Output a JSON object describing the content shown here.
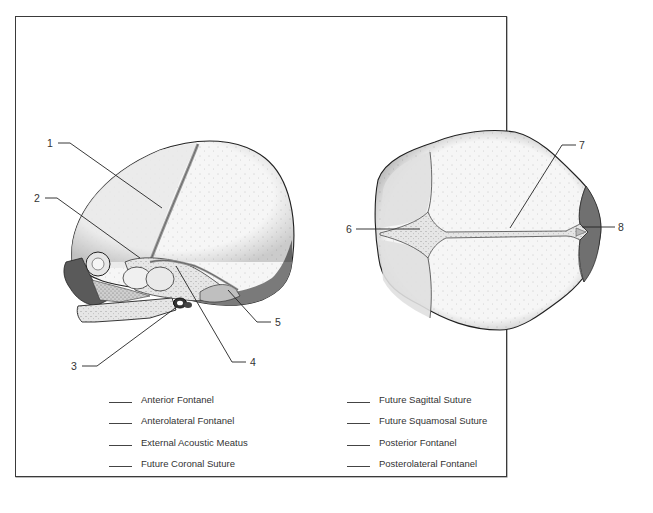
{
  "figure": {
    "views": [
      {
        "id": "lateral",
        "label": "Lateral view of fetal skull"
      },
      {
        "id": "superior",
        "label": "Superior view of fetal skull"
      }
    ],
    "callouts": [
      {
        "number": "1",
        "view": "lateral"
      },
      {
        "number": "2",
        "view": "lateral"
      },
      {
        "number": "3",
        "view": "lateral"
      },
      {
        "number": "4",
        "view": "lateral"
      },
      {
        "number": "5",
        "view": "lateral"
      },
      {
        "number": "6",
        "view": "superior"
      },
      {
        "number": "7",
        "view": "superior"
      },
      {
        "number": "8",
        "view": "superior"
      }
    ]
  },
  "legend": {
    "blank": "____",
    "left_column": [
      {
        "label": "Anterior Fontanel",
        "answer": ""
      },
      {
        "label": "Anterolateral Fontanel",
        "answer": ""
      },
      {
        "label": "External Acoustic Meatus",
        "answer": ""
      },
      {
        "label": "Future Coronal Suture",
        "answer": ""
      }
    ],
    "right_column": [
      {
        "label": "Future Sagittal Suture",
        "answer": ""
      },
      {
        "label": "Future Squamosal Suture",
        "answer": ""
      },
      {
        "label": "Posterior Fontanel",
        "answer": ""
      },
      {
        "label": "Posterolateral Fontanel",
        "answer": ""
      }
    ]
  },
  "colors": {
    "border": "#3a3a3a",
    "bone_light": "#f4f4f4",
    "bone_mid": "#e2e2e2",
    "fontanel": "#c9c9c9",
    "shadow_dark": "#6e6e6e",
    "face_dark": "#4a4a4a",
    "line": "#222222"
  }
}
